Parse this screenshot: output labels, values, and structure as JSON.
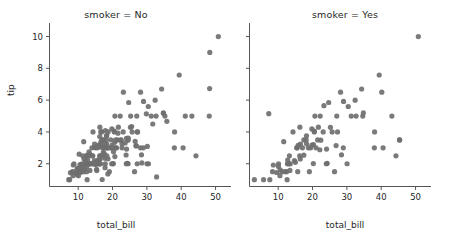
{
  "figure": {
    "background_color": "#ffffff",
    "marker_color": "#6f6f70",
    "axis_color": "#555555",
    "text_color": "#262626"
  },
  "chart_data": {
    "type": "scatter",
    "title": "",
    "xlabel": "total_bill",
    "ylabel": "tip",
    "xlim": [
      1.5,
      54.5
    ],
    "ylim": [
      0.6,
      10.6
    ],
    "xticks": [
      10,
      20,
      30,
      40,
      50
    ],
    "yticks": [
      2,
      4,
      6,
      8,
      10
    ],
    "grid": false,
    "legend": "none",
    "facet_variable": "smoker",
    "shared_y_axis": true,
    "marker_size": 4,
    "facets": [
      {
        "label": "smoker = No",
        "facet_value": "No",
        "xlabel": "total_bill",
        "ylabel": "tip",
        "points": [
          [
            7.25,
            1.0
          ],
          [
            7.51,
            1.0
          ],
          [
            7.74,
            1.44
          ],
          [
            8.35,
            1.5
          ],
          [
            8.51,
            1.25
          ],
          [
            8.52,
            1.48
          ],
          [
            8.58,
            1.92
          ],
          [
            8.77,
            2.0
          ],
          [
            9.55,
            1.45
          ],
          [
            9.6,
            1.61
          ],
          [
            9.68,
            1.32
          ],
          [
            9.78,
            1.73
          ],
          [
            9.94,
            1.56
          ],
          [
            10.07,
            1.25
          ],
          [
            10.27,
            1.71
          ],
          [
            10.29,
            2.6
          ],
          [
            10.33,
            1.67
          ],
          [
            10.34,
            1.66
          ],
          [
            10.51,
            1.95
          ],
          [
            10.59,
            1.61
          ],
          [
            10.63,
            1.73
          ],
          [
            10.65,
            1.5
          ],
          [
            10.77,
            1.47
          ],
          [
            11.02,
            1.98
          ],
          [
            11.24,
            1.76
          ],
          [
            11.35,
            2.5
          ],
          [
            11.38,
            2.0
          ],
          [
            11.59,
            1.5
          ],
          [
            11.61,
            3.39
          ],
          [
            11.69,
            2.31
          ],
          [
            11.87,
            1.63
          ],
          [
            12.02,
            1.97
          ],
          [
            12.16,
            2.2
          ],
          [
            12.26,
            2.0
          ],
          [
            12.43,
            1.8
          ],
          [
            12.46,
            1.5
          ],
          [
            12.48,
            2.52
          ],
          [
            12.54,
            2.0
          ],
          [
            12.6,
            1.0
          ],
          [
            12.66,
            2.5
          ],
          [
            12.74,
            2.01
          ],
          [
            12.76,
            2.23
          ],
          [
            13.0,
            2.0
          ],
          [
            13.03,
            2.0
          ],
          [
            13.13,
            2.0
          ],
          [
            13.16,
            2.75
          ],
          [
            13.27,
            2.5
          ],
          [
            13.37,
            2.0
          ],
          [
            13.39,
            2.61
          ],
          [
            13.42,
            1.58
          ],
          [
            13.51,
            2.0
          ],
          [
            13.81,
            2.0
          ],
          [
            14.0,
            3.0
          ],
          [
            14.07,
            2.5
          ],
          [
            14.15,
            2.0
          ],
          [
            14.26,
            2.5
          ],
          [
            14.31,
            4.0
          ],
          [
            14.52,
            2.0
          ],
          [
            14.73,
            2.2
          ],
          [
            14.78,
            3.23
          ],
          [
            14.83,
            3.02
          ],
          [
            15.01,
            2.09
          ],
          [
            15.04,
            1.96
          ],
          [
            15.06,
            3.0
          ],
          [
            15.36,
            1.64
          ],
          [
            15.42,
            1.57
          ],
          [
            15.48,
            2.02
          ],
          [
            15.69,
            3.0
          ],
          [
            15.77,
            2.23
          ],
          [
            15.81,
            3.16
          ],
          [
            15.95,
            2.0
          ],
          [
            15.98,
            2.03
          ],
          [
            16.0,
            2.0
          ],
          [
            16.04,
            2.24
          ],
          [
            16.21,
            2.0
          ],
          [
            16.27,
            2.5
          ],
          [
            16.29,
            3.71
          ],
          [
            16.31,
            2.0
          ],
          [
            16.32,
            4.3
          ],
          [
            16.4,
            2.5
          ],
          [
            16.43,
            2.3
          ],
          [
            16.45,
            2.47
          ],
          [
            16.47,
            3.23
          ],
          [
            16.49,
            2.0
          ],
          [
            16.58,
            4.0
          ],
          [
            16.66,
            3.4
          ],
          [
            16.82,
            4.0
          ],
          [
            16.93,
            3.07
          ],
          [
            16.97,
            3.5
          ],
          [
            16.99,
            1.01
          ],
          [
            17.07,
            3.0
          ],
          [
            17.29,
            2.71
          ],
          [
            17.31,
            3.5
          ],
          [
            17.46,
            2.54
          ],
          [
            17.51,
            3.0
          ],
          [
            17.59,
            2.64
          ],
          [
            17.78,
            3.27
          ],
          [
            17.81,
            2.34
          ],
          [
            17.82,
            1.75
          ],
          [
            17.89,
            2.0
          ],
          [
            17.92,
            4.08
          ],
          [
            17.92,
            3.08
          ],
          [
            18.04,
            3.0
          ],
          [
            18.15,
            3.5
          ],
          [
            18.24,
            3.76
          ],
          [
            18.26,
            3.25
          ],
          [
            18.29,
            3.0
          ],
          [
            18.29,
            3.76
          ],
          [
            18.35,
            2.5
          ],
          [
            18.43,
            3.0
          ],
          [
            18.64,
            1.36
          ],
          [
            18.69,
            2.31
          ],
          [
            18.71,
            4.0
          ],
          [
            18.78,
            3.0
          ],
          [
            19.08,
            1.5
          ],
          [
            19.44,
            3.0
          ],
          [
            19.49,
            3.51
          ],
          [
            19.65,
            3.0
          ],
          [
            19.77,
            2.0
          ],
          [
            19.81,
            4.19
          ],
          [
            19.82,
            3.18
          ],
          [
            20.09,
            2.0
          ],
          [
            20.23,
            2.01
          ],
          [
            20.29,
            2.75
          ],
          [
            20.45,
            3.0
          ],
          [
            20.49,
            4.06
          ],
          [
            20.53,
            4.0
          ],
          [
            20.65,
            3.35
          ],
          [
            20.69,
            2.45
          ],
          [
            20.69,
            5.0
          ],
          [
            20.9,
            3.5
          ],
          [
            21.01,
            3.0
          ],
          [
            21.16,
            3.0
          ],
          [
            21.5,
            3.5
          ],
          [
            21.58,
            3.92
          ],
          [
            21.7,
            4.3
          ],
          [
            22.23,
            5.0
          ],
          [
            22.42,
            3.48
          ],
          [
            22.49,
            3.5
          ],
          [
            22.75,
            3.25
          ],
          [
            22.76,
            3.0
          ],
          [
            23.1,
            4.0
          ],
          [
            23.17,
            6.5
          ],
          [
            23.68,
            3.31
          ],
          [
            23.95,
            2.55
          ],
          [
            24.01,
            2.0
          ],
          [
            24.06,
            3.6
          ],
          [
            24.08,
            2.92
          ],
          [
            24.27,
            2.03
          ],
          [
            24.52,
            3.48
          ],
          [
            24.55,
            2.0
          ],
          [
            24.59,
            3.61
          ],
          [
            24.71,
            5.85
          ],
          [
            25.21,
            4.29
          ],
          [
            25.28,
            5.0
          ],
          [
            25.56,
            4.34
          ],
          [
            25.71,
            4.0
          ],
          [
            26.41,
            1.5
          ],
          [
            26.59,
            3.41
          ],
          [
            26.86,
            3.14
          ],
          [
            26.88,
            3.12
          ],
          [
            27.05,
            5.0
          ],
          [
            27.18,
            2.0
          ],
          [
            27.2,
            4.0
          ],
          [
            27.28,
            4.0
          ],
          [
            28.15,
            3.0
          ],
          [
            28.17,
            6.5
          ],
          [
            28.44,
            2.56
          ],
          [
            28.55,
            2.05
          ],
          [
            28.97,
            3.0
          ],
          [
            29.03,
            5.92
          ],
          [
            29.85,
            5.14
          ],
          [
            30.06,
            2.0
          ],
          [
            30.14,
            3.09
          ],
          [
            30.4,
            5.6
          ],
          [
            30.46,
            2.0
          ],
          [
            31.27,
            5.0
          ],
          [
            31.71,
            4.5
          ],
          [
            32.4,
            6.0
          ],
          [
            32.68,
            5.0
          ],
          [
            32.83,
            1.17
          ],
          [
            34.3,
            6.7
          ],
          [
            34.81,
            5.2
          ],
          [
            34.83,
            5.17
          ],
          [
            35.26,
            5.0
          ],
          [
            35.83,
            4.67
          ],
          [
            38.01,
            3.0
          ],
          [
            38.07,
            4.0
          ],
          [
            39.42,
            7.58
          ],
          [
            40.55,
            3.0
          ],
          [
            41.19,
            5.0
          ],
          [
            43.11,
            5.0
          ],
          [
            44.3,
            2.5
          ],
          [
            48.17,
            5.0
          ],
          [
            48.27,
            6.73
          ],
          [
            48.33,
            9.0
          ],
          [
            50.81,
            10.0
          ]
        ]
      },
      {
        "label": "smoker = Yes",
        "facet_value": "Yes",
        "xlabel": "total_bill",
        "ylabel": "tip",
        "points": [
          [
            3.07,
            1.0
          ],
          [
            5.75,
            1.0
          ],
          [
            7.25,
            5.15
          ],
          [
            7.56,
            1.0
          ],
          [
            8.35,
            1.5
          ],
          [
            8.58,
            1.92
          ],
          [
            9.55,
            1.45
          ],
          [
            10.07,
            1.83
          ],
          [
            10.09,
            2.0
          ],
          [
            10.51,
            1.25
          ],
          [
            10.59,
            1.61
          ],
          [
            11.17,
            1.5
          ],
          [
            11.61,
            3.39
          ],
          [
            12.03,
            1.5
          ],
          [
            12.46,
            1.5
          ],
          [
            12.6,
            1.0
          ],
          [
            12.69,
            2.0
          ],
          [
            12.76,
            2.23
          ],
          [
            13.0,
            2.0
          ],
          [
            13.13,
            2.0
          ],
          [
            13.27,
            2.5
          ],
          [
            13.42,
            1.58
          ],
          [
            13.51,
            2.0
          ],
          [
            14.31,
            4.0
          ],
          [
            14.73,
            2.2
          ],
          [
            15.01,
            2.09
          ],
          [
            15.38,
            3.0
          ],
          [
            15.53,
            3.0
          ],
          [
            15.69,
            1.5
          ],
          [
            15.81,
            3.16
          ],
          [
            16.27,
            2.5
          ],
          [
            16.32,
            4.3
          ],
          [
            16.43,
            2.3
          ],
          [
            16.47,
            3.23
          ],
          [
            17.07,
            3.0
          ],
          [
            17.46,
            2.54
          ],
          [
            17.47,
            3.5
          ],
          [
            18.15,
            3.5
          ],
          [
            18.24,
            3.76
          ],
          [
            18.26,
            3.25
          ],
          [
            18.78,
            3.0
          ],
          [
            19.08,
            1.5
          ],
          [
            19.44,
            3.0
          ],
          [
            19.81,
            4.19
          ],
          [
            19.82,
            3.18
          ],
          [
            20.23,
            2.01
          ],
          [
            20.29,
            3.21
          ],
          [
            20.49,
            4.06
          ],
          [
            20.53,
            4.0
          ],
          [
            20.69,
            5.0
          ],
          [
            21.01,
            3.0
          ],
          [
            21.5,
            3.5
          ],
          [
            21.7,
            4.3
          ],
          [
            22.12,
            2.88
          ],
          [
            22.23,
            5.0
          ],
          [
            22.42,
            3.48
          ],
          [
            23.1,
            4.0
          ],
          [
            23.33,
            5.65
          ],
          [
            24.01,
            2.0
          ],
          [
            24.08,
            2.92
          ],
          [
            24.27,
            2.03
          ],
          [
            24.71,
            5.85
          ],
          [
            25.21,
            4.29
          ],
          [
            25.71,
            4.0
          ],
          [
            26.41,
            1.5
          ],
          [
            26.86,
            3.14
          ],
          [
            27.05,
            5.0
          ],
          [
            27.28,
            4.0
          ],
          [
            28.17,
            6.5
          ],
          [
            28.44,
            2.56
          ],
          [
            28.97,
            3.0
          ],
          [
            29.03,
            5.92
          ],
          [
            30.06,
            2.0
          ],
          [
            30.4,
            5.6
          ],
          [
            31.27,
            5.0
          ],
          [
            32.4,
            6.0
          ],
          [
            32.68,
            5.0
          ],
          [
            34.3,
            6.7
          ],
          [
            34.63,
            5.0
          ],
          [
            34.81,
            5.2
          ],
          [
            38.01,
            3.0
          ],
          [
            38.07,
            4.0
          ],
          [
            39.42,
            7.58
          ],
          [
            40.17,
            6.5
          ],
          [
            40.55,
            3.0
          ],
          [
            43.11,
            5.0
          ],
          [
            44.3,
            2.5
          ],
          [
            45.35,
            3.5
          ],
          [
            45.35,
            3.5
          ],
          [
            50.81,
            10.0
          ]
        ]
      }
    ]
  }
}
